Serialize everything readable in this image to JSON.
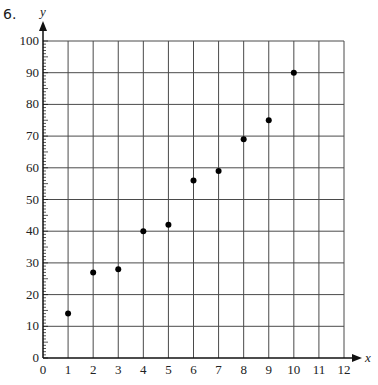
{
  "question_number": "6.",
  "chart_data": {
    "type": "scatter",
    "title": "",
    "xlabel": "x",
    "ylabel": "y",
    "xlim": [
      0,
      12
    ],
    "ylim": [
      0,
      100
    ],
    "x_ticks": [
      0,
      1,
      2,
      3,
      4,
      5,
      6,
      7,
      8,
      9,
      10,
      11,
      12
    ],
    "y_ticks": [
      0,
      10,
      20,
      30,
      40,
      50,
      60,
      70,
      80,
      90,
      100
    ],
    "y_minor_tick_step": 1,
    "grid": true,
    "legend": null,
    "series": [
      {
        "name": "points",
        "x": [
          1,
          2,
          3,
          4,
          5,
          6,
          7,
          8,
          9,
          10
        ],
        "y": [
          14,
          27,
          28,
          40,
          42,
          56,
          59,
          69,
          75,
          90
        ]
      }
    ]
  },
  "colors": {
    "grid": "#4a4a4a",
    "axis": "#111111",
    "point": "#000000",
    "background": "#ffffff"
  }
}
